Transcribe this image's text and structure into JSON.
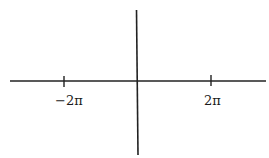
{
  "diagram": {
    "type": "coordinate-axes",
    "line_color": "#222222",
    "x_axis": {
      "ticks": [
        {
          "label": "−2π",
          "value": "-2pi"
        },
        {
          "label": "2π",
          "value": "2pi"
        }
      ]
    }
  }
}
